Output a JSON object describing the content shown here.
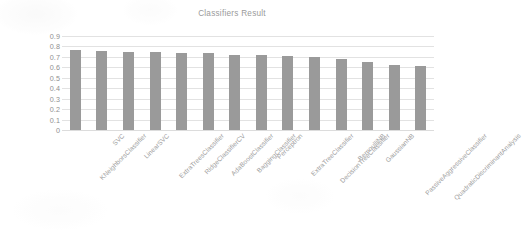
{
  "chart_data": {
    "type": "bar",
    "title": "Classifiers Result",
    "xlabel": "",
    "ylabel": "",
    "ylim": [
      0,
      0.9
    ],
    "grid": true,
    "legend": false,
    "bar_color": "#9a9a9a",
    "gridline_color": "#e2e2e2",
    "text_color": "#9a9a9a",
    "y_ticks": [
      "0.9",
      "0.8",
      "0.7",
      "0.6",
      "0.5",
      "0.4",
      "0.3",
      "0.2",
      "0.1",
      "0"
    ],
    "y_tick_values": [
      0.9,
      0.8,
      0.7,
      0.6,
      0.5,
      0.4,
      0.3,
      0.2,
      0.1,
      0
    ],
    "categories": [
      "KNeighborsClassifier",
      "SVC",
      "LinearSVC",
      "ExtraTreesClassifier",
      "RidgeClassifierCV",
      "AdaBoostClassifier",
      "BaggingClassifier",
      "Perceptron",
      "ExtraTreeClassifier",
      "DecisionTreeClassifier",
      "BernoulliNB",
      "GaussianNB",
      "PassiveAggressiveClassifier",
      "QuadraticDiscriminantAnalysis"
    ],
    "values": [
      0.763,
      0.757,
      0.751,
      0.745,
      0.741,
      0.741,
      0.722,
      0.722,
      0.712,
      0.7,
      0.677,
      0.65,
      0.627,
      0.61
    ]
  }
}
